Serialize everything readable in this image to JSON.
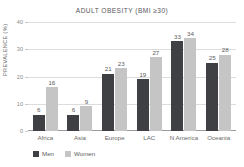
{
  "chart_data": {
    "type": "bar",
    "title": "ADULT OBESITY (BMI ≥30)",
    "xlabel": "",
    "ylabel": "PREVALENCE (%)",
    "ylim": [
      0,
      40
    ],
    "yticks": [
      0,
      10,
      20,
      30,
      40
    ],
    "ytick_labels": [
      "0",
      "10",
      "20",
      "30",
      "40"
    ],
    "grid": true,
    "legend_position": "bottom-left",
    "categories": [
      "Africa",
      "Asia",
      "Europe",
      "LAC",
      "N America",
      "Oceania"
    ],
    "series": [
      {
        "name": "Men",
        "color": "#3f4044",
        "values": [
          6,
          6,
          21,
          19,
          33,
          25
        ],
        "labels": [
          "6",
          "6",
          "21",
          "19",
          "33",
          "25"
        ]
      },
      {
        "name": "Women",
        "color": "#c5c5c5",
        "values": [
          16,
          9,
          23,
          27,
          34,
          28
        ],
        "labels": [
          "16",
          "9",
          "23",
          "27",
          "34",
          "28"
        ]
      }
    ]
  }
}
